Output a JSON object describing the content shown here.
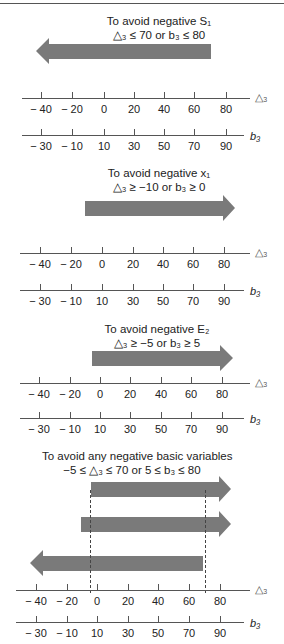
{
  "panels": [
    {
      "caption_line1": "To avoid negative S₁",
      "caption_line2": "△₃ ≤ 70 or b₃ ≤ 80"
    },
    {
      "caption_line1": "To avoid negative x₁",
      "caption_line2": "△₃ ≥ −10 or b₃ ≥ 0"
    },
    {
      "caption_line1": "To avoid negative E₂",
      "caption_line2": "△₃ ≥ −5 or b₃ ≥ 5"
    },
    {
      "caption_line1": "To avoid any negative basic variables",
      "caption_line2": "−5 ≤ △₃ ≤ 70 or 5 ≤ b₃ ≤ 80"
    }
  ],
  "axes": {
    "delta_name": "△₃",
    "b_name": "b₃",
    "delta_ticks": [
      "− 40",
      "− 20",
      "0",
      "20",
      "40",
      "60",
      "80"
    ],
    "b_ticks": [
      "− 30",
      "− 10",
      "10",
      "30",
      "50",
      "70",
      "90"
    ]
  },
  "colors": {
    "arrow": "#7a7a7a",
    "axis": "#555555"
  }
}
